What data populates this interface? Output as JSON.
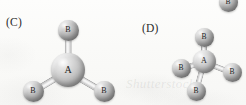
{
  "figure": {
    "caption_watermark": "Shutterstock",
    "background_color": "#fbfbfa",
    "atom_central_color": "#c2c2c2",
    "atom_terminal_color": "#b2b2b2",
    "bond_color": "#dedede"
  },
  "panels": [
    {
      "id": "c",
      "label": "(C)",
      "label_x": 6,
      "label_y": 16,
      "geometry": "trigonal pyramidal AB3",
      "atoms": [
        {
          "name": "central-atom-a",
          "label": "A",
          "x": 68,
          "y": 70,
          "r": 17,
          "font_size": 10,
          "kind": "central"
        },
        {
          "name": "terminal-atom-b-top",
          "label": "B",
          "x": 68,
          "y": 30,
          "r": 10.5,
          "font_size": 8,
          "kind": "terminal"
        },
        {
          "name": "terminal-atom-b-bottom-left",
          "label": "B",
          "x": 33,
          "y": 91,
          "r": 10.5,
          "font_size": 8,
          "kind": "terminal"
        },
        {
          "name": "terminal-atom-b-bottom-right",
          "label": "B",
          "x": 104,
          "y": 91,
          "r": 10.5,
          "font_size": 8,
          "kind": "terminal"
        }
      ],
      "bonds": [
        {
          "name": "bond-a-to-b-top",
          "x1": 68,
          "y1": 70,
          "x2": 68,
          "y2": 30,
          "width": 4.5
        },
        {
          "name": "bond-a-to-b-bottom-left",
          "x1": 68,
          "y1": 70,
          "x2": 33,
          "y2": 91,
          "width": 4.5
        },
        {
          "name": "bond-a-to-b-bottom-right",
          "x1": 68,
          "y1": 70,
          "x2": 104,
          "y2": 91,
          "width": 4.5
        }
      ]
    },
    {
      "id": "d",
      "label": "(D)",
      "label_x": 142,
      "label_y": 22,
      "geometry": "tetrahedral AB4",
      "atoms": [
        {
          "name": "central-atom-a",
          "label": "A",
          "x": 204,
          "y": 61,
          "r": 11.5,
          "font_size": 8,
          "kind": "central"
        },
        {
          "name": "terminal-atom-b-top",
          "label": "B",
          "x": 204,
          "y": 37,
          "r": 9.5,
          "font_size": 7.5,
          "kind": "terminal"
        },
        {
          "name": "terminal-atom-b-left",
          "label": "B",
          "x": 181,
          "y": 68,
          "r": 9.5,
          "font_size": 7.5,
          "kind": "terminal"
        },
        {
          "name": "terminal-atom-b-right",
          "label": "B",
          "x": 232,
          "y": 72,
          "r": 9.5,
          "font_size": 7.5,
          "kind": "terminal"
        },
        {
          "name": "terminal-atom-b-bottom",
          "label": "B",
          "x": 196,
          "y": 91,
          "r": 9.5,
          "font_size": 7.5,
          "kind": "terminal"
        }
      ],
      "bonds": [
        {
          "name": "bond-a-to-b-top",
          "x1": 204,
          "y1": 61,
          "x2": 204,
          "y2": 37,
          "width": 4
        },
        {
          "name": "bond-a-to-b-left",
          "x1": 204,
          "y1": 61,
          "x2": 181,
          "y2": 68,
          "width": 4
        },
        {
          "name": "bond-a-to-b-right",
          "x1": 204,
          "y1": 61,
          "x2": 232,
          "y2": 72,
          "width": 4
        },
        {
          "name": "bond-a-to-b-bottom",
          "x1": 204,
          "y1": 61,
          "x2": 196,
          "y2": 91,
          "width": 4
        }
      ]
    }
  ],
  "cropped_atoms": [
    {
      "name": "cropped-atom-b-top-right",
      "label": "B",
      "x": 228,
      "y": 2,
      "r": 9.5,
      "font_size": 7.5,
      "kind": "terminal"
    }
  ]
}
